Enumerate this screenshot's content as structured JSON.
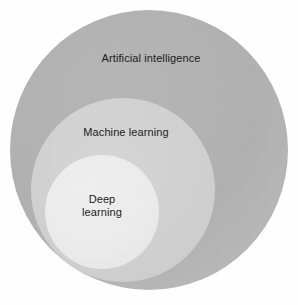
{
  "figure": {
    "type": "nested-circles-venn",
    "background_color": "#ffffff",
    "description_alt": "Three nested circles showing Deep learning inside Machine learning inside Artificial intelligence"
  },
  "circles": [
    {
      "id": "artificial-intelligence",
      "label": "Artificial intelligence",
      "fill_color": "#b1b1b1",
      "level": 1,
      "center_x": 149,
      "center_y": 150,
      "radius": 139
    },
    {
      "id": "machine-learning",
      "label": "Machine learning",
      "fill_color": "#d0d0d0",
      "level": 2,
      "center_x": 123,
      "center_y": 190,
      "radius": 92
    },
    {
      "id": "deep-learning",
      "label": "Deep\nlearning",
      "fill_color": "#ebebeb",
      "level": 3,
      "center_x": 102,
      "center_y": 212,
      "radius": 57
    }
  ],
  "labels": {
    "outer": "Artificial intelligence",
    "middle": "Machine learning",
    "inner": "Deep\nlearning",
    "text_color": "#1b1b1b"
  }
}
